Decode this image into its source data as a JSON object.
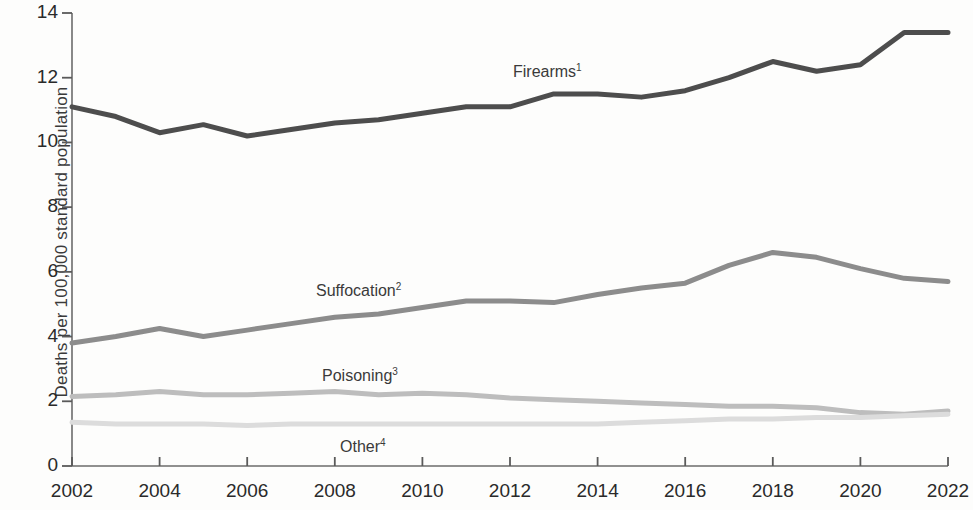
{
  "chart_data": {
    "type": "line",
    "title": "",
    "xlabel": "",
    "ylabel": "Deaths per 100,000 standard population",
    "xlim": [
      2002,
      2022
    ],
    "ylim": [
      0,
      14
    ],
    "ytick_labels": [
      "14",
      "12",
      "10",
      "8",
      "6",
      "4",
      "2",
      "0"
    ],
    "ytick_values": [
      14,
      12,
      10,
      8,
      6,
      4,
      2,
      0
    ],
    "xtick_labels": [
      "2002",
      "2004",
      "2006",
      "2008",
      "2010",
      "2012",
      "2014",
      "2016",
      "2018",
      "2020",
      "2022"
    ],
    "xtick_values": [
      2002,
      2004,
      2006,
      2008,
      2010,
      2012,
      2014,
      2016,
      2018,
      2020,
      2022
    ],
    "x": [
      2002,
      2003,
      2004,
      2005,
      2006,
      2007,
      2008,
      2009,
      2010,
      2011,
      2012,
      2013,
      2014,
      2015,
      2016,
      2017,
      2018,
      2019,
      2020,
      2021,
      2022
    ],
    "grid": false,
    "legend": "inline-labels",
    "series": [
      {
        "name": "Firearms",
        "footnote": "1",
        "color": "#4d4d4d",
        "values": [
          11.1,
          10.8,
          10.3,
          10.55,
          10.2,
          10.4,
          10.6,
          10.7,
          10.9,
          11.1,
          11.1,
          11.5,
          11.5,
          11.4,
          11.6,
          12.0,
          12.5,
          12.2,
          12.4,
          13.4,
          13.4
        ]
      },
      {
        "name": "Suffocation",
        "footnote": "2",
        "color": "#8c8c8c",
        "values": [
          3.8,
          4.0,
          4.25,
          4.0,
          4.2,
          4.4,
          4.6,
          4.7,
          4.9,
          5.1,
          5.1,
          5.05,
          5.3,
          5.5,
          5.65,
          6.2,
          6.6,
          6.45,
          6.1,
          5.8,
          5.7
        ]
      },
      {
        "name": "Poisoning",
        "footnote": "3",
        "color": "#bdbdbd",
        "values": [
          2.15,
          2.2,
          2.3,
          2.2,
          2.2,
          2.25,
          2.3,
          2.2,
          2.25,
          2.2,
          2.1,
          2.05,
          2.0,
          1.95,
          1.9,
          1.85,
          1.85,
          1.8,
          1.65,
          1.6,
          1.7
        ]
      },
      {
        "name": "Other",
        "footnote": "4",
        "color": "#dcdcdc",
        "values": [
          1.35,
          1.3,
          1.3,
          1.3,
          1.25,
          1.3,
          1.3,
          1.3,
          1.3,
          1.3,
          1.3,
          1.3,
          1.3,
          1.35,
          1.4,
          1.45,
          1.45,
          1.5,
          1.5,
          1.55,
          1.6
        ]
      }
    ],
    "annotations": [
      {
        "text": "Firearms",
        "footnote": "1",
        "x_px": 513,
        "y_px": 62
      },
      {
        "text": "Suffocation",
        "footnote": "2",
        "x_px": 316,
        "y_px": 281
      },
      {
        "text": "Poisoning",
        "footnote": "3",
        "x_px": 322,
        "y_px": 366
      },
      {
        "text": "Other",
        "footnote": "4",
        "x_px": 340,
        "y_px": 437
      }
    ]
  }
}
